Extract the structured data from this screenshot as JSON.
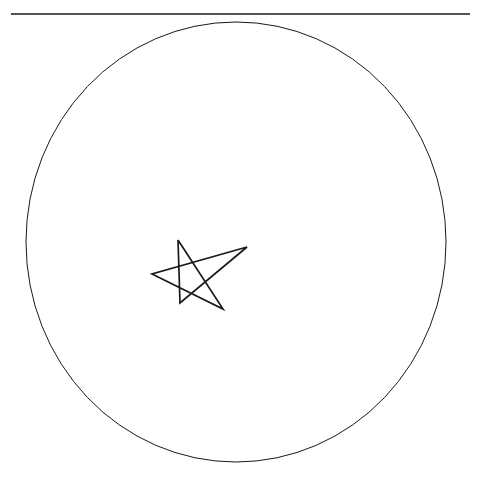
{
  "canvas": {
    "width": 477,
    "height": 478,
    "background_color": "#ffffff",
    "description": "Turtle graphics drawing on a blank white canvas"
  },
  "drawing": {
    "stroke_color": "#1a1a1a",
    "shapes": [
      {
        "name": "horizontal-rule",
        "type": "line",
        "stroke_width": 1.6,
        "points": [
          [
            11,
            14
          ],
          [
            470,
            14
          ]
        ]
      },
      {
        "name": "large-circle",
        "type": "ellipse",
        "stroke_width": 1.0,
        "cx": 236,
        "cy": 242,
        "rx": 210,
        "ry": 220
      },
      {
        "name": "five-pointed-star",
        "type": "polygon",
        "stroke_width": 1.7,
        "points": [
          [
            178,
            240
          ],
          [
            223,
            309
          ],
          [
            152,
            274
          ],
          [
            247,
            247
          ],
          [
            180,
            303
          ],
          [
            178,
            240
          ]
        ]
      }
    ]
  }
}
